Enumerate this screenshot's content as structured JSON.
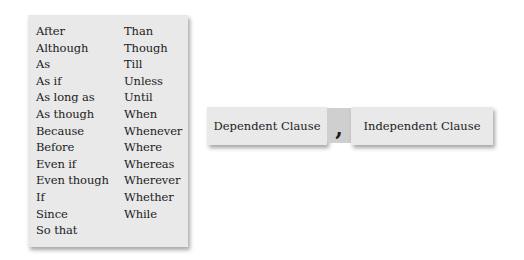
{
  "conjunction_list": {
    "left_column": [
      "After",
      "Although",
      "As",
      "As if",
      "As long as",
      "As though",
      "Because",
      "Before",
      "Even if",
      "Even though",
      "If",
      "Since",
      "So that"
    ],
    "right_column": [
      "Than",
      "Though",
      "Till",
      "Unless",
      "Until",
      "When",
      "Whenever",
      "Where",
      "Whereas",
      "Wherever",
      "Whether",
      "While"
    ]
  },
  "sentence_structure": {
    "dependent_clause": "Dependent Clause",
    "separator": ",",
    "independent_clause": "Independent Clause"
  },
  "colors": {
    "box_background": "#e9e9e9",
    "separator_background": "#cfcfcf",
    "text": "#1c1c1c"
  }
}
